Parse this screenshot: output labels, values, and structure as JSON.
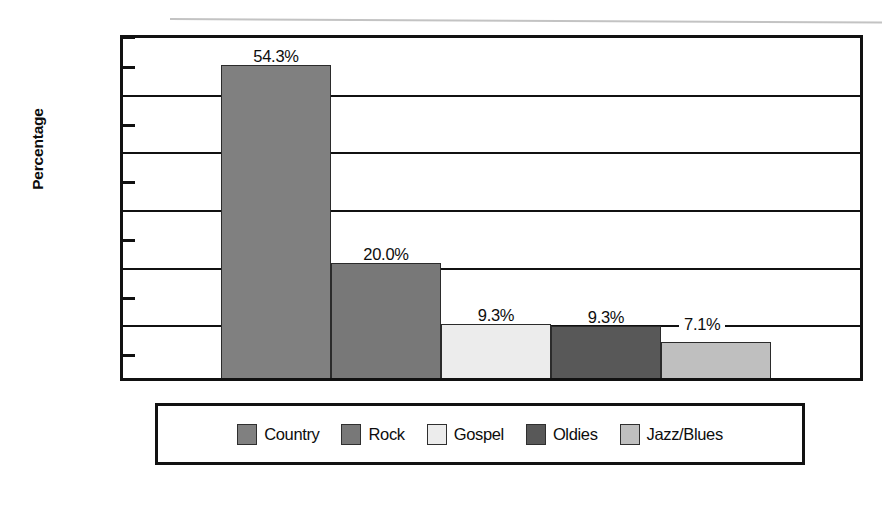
{
  "chart_data": {
    "type": "bar",
    "title": "",
    "xlabel": "",
    "ylabel": "Percentage",
    "categories": [
      "Country",
      "Rock",
      "Gospel",
      "Oldies",
      "Jazz/Blues"
    ],
    "values": [
      54.3,
      20.0,
      9.3,
      9.3,
      7.1
    ],
    "value_labels": [
      "54.3%",
      "20.0%",
      "9.3%",
      "9.3%",
      "7.1%"
    ],
    "bar_colors": [
      "#808080",
      "#787878",
      "#ececec",
      "#585858",
      "#bfbfbf"
    ],
    "ylim": [
      0,
      60
    ],
    "y_ticks": [
      0,
      10,
      20,
      30,
      40,
      50,
      60
    ],
    "y_tick_labels": [
      "0%",
      "10%",
      "20%",
      "30%",
      "40%",
      "50%",
      "60%"
    ],
    "y_minor_ticks": [
      5,
      15,
      25,
      35,
      45,
      55
    ],
    "grid": true,
    "legend_position": "bottom",
    "legend": [
      {
        "label": "Country",
        "color": "#808080"
      },
      {
        "label": "Rock",
        "color": "#787878"
      },
      {
        "label": "Gospel",
        "color": "#ececec"
      },
      {
        "label": "Oldies",
        "color": "#585858"
      },
      {
        "label": "Jazz/Blues",
        "color": "#bfbfbf"
      }
    ]
  },
  "axis": {
    "y_title": "Percentage"
  },
  "colors": {
    "axis_line": "#111111",
    "background": "#ffffff",
    "text": "#0d0d0d"
  }
}
